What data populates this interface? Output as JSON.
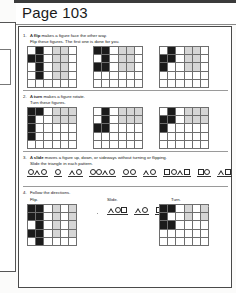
{
  "document": {
    "header_title": "Page 103"
  },
  "questions": [
    {
      "number": "1.",
      "line1_prefix": "A ",
      "line1_bold": "flip",
      "line1_suffix": " makes a figure face the other way.",
      "line2": "Flip these figures. The first one is done for you."
    },
    {
      "number": "2.",
      "line1_prefix": "A ",
      "line1_bold": "turn",
      "line1_suffix": " makes a figure rotate.",
      "line2": "Turn these figures."
    },
    {
      "number": "3.",
      "line1_prefix": "A ",
      "line1_bold": "slide",
      "line1_suffix": " moves a figure up, down, or sideways without turning or flipping.",
      "line2": "Slide the triangle in each pattern."
    },
    {
      "number": "4.",
      "line1_prefix": "",
      "line1_bold": "",
      "line1_suffix": "Follow the directions.",
      "line2": ""
    }
  ],
  "labels": {
    "flip": "Flip.",
    "slide": "Slide.",
    "turn": "Turn."
  },
  "grids": {
    "q1": [
      {
        "cols": 6,
        "rows": 5,
        "cells": [
          "white",
          "black",
          "white",
          "gray",
          "gray",
          "white",
          "black",
          "black",
          "white",
          "gray",
          "gray",
          "white",
          "white",
          "black",
          "white",
          "gray",
          "gray",
          "white",
          "white",
          "black",
          "white",
          "gray",
          "gray",
          "white",
          "white",
          "white",
          "white",
          "white",
          "white",
          "white"
        ]
      },
      {
        "cols": 6,
        "rows": 5,
        "cells": [
          "black",
          "black",
          "white",
          "gray",
          "gray",
          "white",
          "white",
          "black",
          "white",
          "gray",
          "gray",
          "white",
          "black",
          "black",
          "white",
          "gray",
          "gray",
          "white",
          "white",
          "white",
          "white",
          "white",
          "white",
          "white",
          "white",
          "white",
          "white",
          "white",
          "white",
          "white"
        ]
      },
      {
        "cols": 6,
        "rows": 5,
        "cells": [
          "white",
          "black",
          "white",
          "gray",
          "gray",
          "white",
          "black",
          "black",
          "white",
          "gray",
          "gray",
          "white",
          "black",
          "white",
          "white",
          "gray",
          "gray",
          "white",
          "white",
          "white",
          "white",
          "white",
          "white",
          "white",
          "white",
          "white",
          "white",
          "white",
          "white",
          "white"
        ]
      }
    ],
    "q2": [
      {
        "cols": 6,
        "rows": 5,
        "cells": [
          "black",
          "black",
          "white",
          "gray",
          "gray",
          "gray",
          "black",
          "white",
          "white",
          "gray",
          "gray",
          "gray",
          "black",
          "white",
          "white",
          "white",
          "white",
          "white",
          "black",
          "white",
          "white",
          "white",
          "white",
          "white",
          "white",
          "white",
          "white",
          "white",
          "white",
          "white"
        ]
      },
      {
        "cols": 6,
        "rows": 5,
        "cells": [
          "white",
          "black",
          "white",
          "gray",
          "gray",
          "gray",
          "white",
          "black",
          "white",
          "gray",
          "gray",
          "gray",
          "black",
          "black",
          "white",
          "white",
          "white",
          "white",
          "white",
          "white",
          "white",
          "white",
          "white",
          "white",
          "white",
          "white",
          "white",
          "white",
          "white",
          "white"
        ]
      },
      {
        "cols": 6,
        "rows": 5,
        "cells": [
          "white",
          "black",
          "white",
          "gray",
          "gray",
          "gray",
          "black",
          "black",
          "white",
          "gray",
          "gray",
          "gray",
          "black",
          "white",
          "white",
          "white",
          "white",
          "white",
          "white",
          "white",
          "white",
          "white",
          "white",
          "white",
          "white",
          "white",
          "white",
          "white",
          "white",
          "white"
        ]
      }
    ],
    "q4_flip": {
      "cols": 6,
      "rows": 5,
      "cells": [
        "black",
        "black",
        "white",
        "gray",
        "white",
        "gray",
        "black",
        "black",
        "white",
        "gray",
        "white",
        "gray",
        "white",
        "black",
        "white",
        "gray",
        "white",
        "gray",
        "black",
        "black",
        "white",
        "gray",
        "white",
        "gray",
        "white",
        "black",
        "white",
        "white",
        "white",
        "white"
      ]
    },
    "q4_turn": {
      "cols": 6,
      "rows": 5,
      "cells": [
        "black",
        "black",
        "white",
        "gray",
        "white",
        "gray",
        "black",
        "white",
        "white",
        "gray",
        "white",
        "gray",
        "black",
        "black",
        "white",
        "white",
        "white",
        "white",
        "white",
        "white",
        "white",
        "white",
        "white",
        "white",
        "white",
        "white",
        "white",
        "white",
        "white",
        "white"
      ]
    }
  },
  "patterns": {
    "q3_groups": [
      {
        "shapes": [
          "circle",
          "triangle",
          "circle"
        ]
      },
      {
        "shapes": [
          "circle"
        ]
      },
      {
        "shapes": [
          "triangle",
          "circle"
        ]
      },
      {
        "shapes": [
          "circle",
          "circle",
          "triangle",
          "circle"
        ]
      },
      {
        "shapes": [
          "circle",
          "circle"
        ]
      },
      {
        "shapes": [
          "triangle",
          "circle"
        ]
      },
      {
        "shapes": [
          "square",
          "circle",
          "triangle",
          "square"
        ]
      },
      {
        "shapes": [
          "square",
          "circle"
        ]
      },
      {
        "shapes": [
          "triangle",
          "square"
        ]
      }
    ],
    "q4_slide_groups": [
      {
        "shapes": [
          "triangle",
          "circle",
          "square"
        ]
      },
      {
        "shapes": [
          "triangle",
          "circle"
        ]
      },
      {
        "shapes": [
          "square"
        ]
      }
    ]
  }
}
